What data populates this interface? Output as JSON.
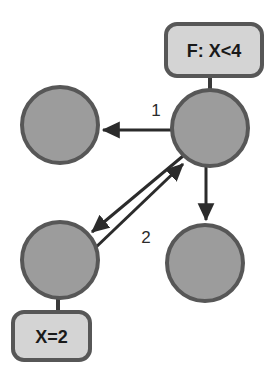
{
  "diagram": {
    "background_color": "#ffffff",
    "node_fill_color": "#9c9c9c",
    "node_stroke_color": "#575757",
    "box_fill_color": "#d4d4d4",
    "box_stroke_color": "#575757",
    "edge_color": "#2b2b2b",
    "nodes": [
      {
        "id": "top-left",
        "name": "node-top-left",
        "cx": 60,
        "cy": 125,
        "r": 38
      },
      {
        "id": "top-right",
        "name": "node-top-right",
        "cx": 210,
        "cy": 128,
        "r": 38
      },
      {
        "id": "bottom-left",
        "name": "node-bottom-left",
        "cx": 60,
        "cy": 260,
        "r": 38
      },
      {
        "id": "bottom-right",
        "name": "node-bottom-right",
        "cx": 205,
        "cy": 263,
        "r": 38
      }
    ],
    "boxes": [
      {
        "id": "formula-box",
        "name": "formula-label-box",
        "text": "F: X<4",
        "x": 166,
        "y": 24,
        "width": 96,
        "height": 52,
        "rx": 11,
        "attached_to": "top-right"
      },
      {
        "id": "assignment-box",
        "name": "assignment-label-box",
        "text": "X=2",
        "x": 13,
        "y": 312,
        "width": 77,
        "height": 48,
        "rx": 11,
        "attached_to": "bottom-left"
      }
    ],
    "edges": [
      {
        "id": "edge-1",
        "name": "edge-top-right-to-top-left",
        "label": "1",
        "from": "top-right",
        "to": "top-left",
        "label_x": 156,
        "label_y": 110,
        "direction": "left"
      },
      {
        "id": "edge-2",
        "name": "edge-bottom-left-to-top-right",
        "label": "2",
        "from": "bottom-left",
        "to": "top-right",
        "label_x": 146,
        "label_y": 237,
        "direction": "up-right"
      },
      {
        "id": "edge-3",
        "name": "edge-top-right-to-bottom-left",
        "label": "",
        "from": "top-right",
        "to": "bottom-left",
        "direction": "down-left"
      },
      {
        "id": "edge-4",
        "name": "edge-top-right-to-bottom-right",
        "label": "",
        "from": "top-right",
        "to": "bottom-right",
        "direction": "down"
      }
    ],
    "connectors": [
      {
        "id": "stem-formula",
        "name": "connector-top-right-to-formula-box",
        "x1": 210,
        "y1": 90,
        "x2": 210,
        "y2": 76
      },
      {
        "id": "stem-assignment",
        "name": "connector-bottom-left-to-assignment-box",
        "x1": 58,
        "y1": 298,
        "x2": 58,
        "y2": 312
      }
    ]
  }
}
